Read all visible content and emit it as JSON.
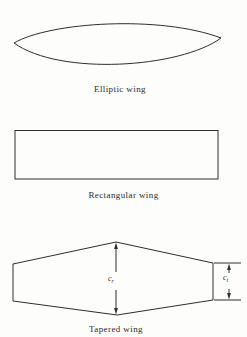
{
  "figure": {
    "background_color": "#fdfdfc",
    "line_color": "#2e2e2e",
    "wings": [
      {
        "id": "elliptic",
        "caption": "Elliptic wing"
      },
      {
        "id": "rectangular",
        "caption": "Rectangular wing"
      },
      {
        "id": "tapered",
        "caption": "Tapered wing"
      }
    ],
    "dimensions": {
      "root_chord": {
        "base": "c",
        "sub": "r"
      },
      "tip_chord": {
        "base": "c",
        "sub": "t"
      }
    }
  }
}
